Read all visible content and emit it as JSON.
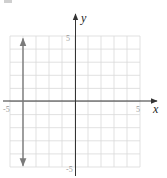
{
  "chart_data": {
    "type": "line",
    "title": "",
    "xlabel": "x",
    "ylabel": "y",
    "xlim": [
      -5,
      5
    ],
    "ylim": [
      -5,
      5
    ],
    "grid": true,
    "grid_step": 1,
    "tick_labels": {
      "x_min": "-5",
      "x_max": "5",
      "y_min": "-5",
      "y_max": "5"
    },
    "series": [
      {
        "name": "x = -4",
        "kind": "vertical-line",
        "x": [
          -4,
          -4
        ],
        "y": [
          -4.9,
          4.8
        ],
        "arrows": "both",
        "color": "#7a7a7a"
      }
    ],
    "legend": null
  },
  "colors": {
    "grid": "#d9d9d9",
    "axis": "#333333",
    "graph": "#7a7a7a",
    "tick_text": "#9a9a9a"
  }
}
